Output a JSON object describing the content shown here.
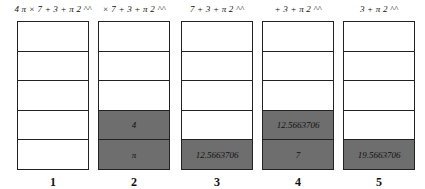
{
  "diagram": {
    "type": "stack-evaluation-steps",
    "fill_color": "#6e6e6e",
    "steps": [
      {
        "label": "1",
        "expression": "4 π × 7 + 3 + π 2 ^^",
        "cells": [
          "",
          "",
          "",
          "",
          ""
        ]
      },
      {
        "label": "2",
        "expression": "× 7 + 3 + π 2 ^^",
        "cells": [
          "",
          "",
          "",
          "4",
          "π"
        ]
      },
      {
        "label": "3",
        "expression": "7 + 3 + π 2 ^^",
        "cells": [
          "",
          "",
          "",
          "",
          "12.5663706"
        ]
      },
      {
        "label": "4",
        "expression": "+ 3 + π 2 ^^",
        "cells": [
          "",
          "",
          "",
          "12.5663706",
          "7"
        ]
      },
      {
        "label": "5",
        "expression": "3 + π 2 ^^",
        "cells": [
          "",
          "",
          "",
          "",
          "19.5663706"
        ]
      }
    ]
  }
}
